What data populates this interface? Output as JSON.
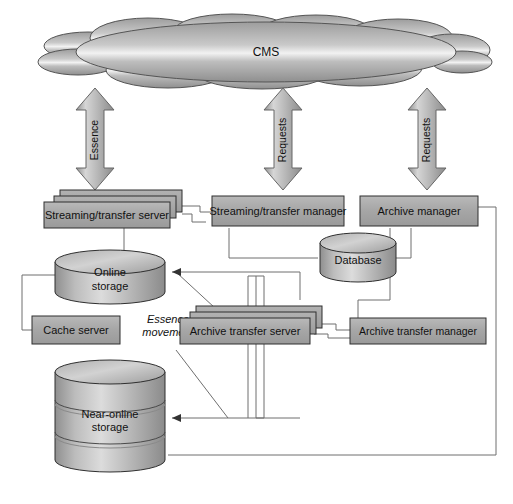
{
  "figure": {
    "background_color": "#ffffff",
    "line_color": "#6b6b6b",
    "box_fill": "#a8a8a8",
    "box_stroke": "#2f2f2f",
    "cloud_label": "CMS"
  },
  "cloud": {
    "name": "cms-cloud",
    "label": "CMS"
  },
  "arrows": [
    {
      "id": "essence",
      "label": "Essence",
      "x": 95
    },
    {
      "id": "requests-center",
      "label": "Requests",
      "x": 283
    },
    {
      "id": "requests-right",
      "label": "Requests",
      "x": 427
    }
  ],
  "nodes": {
    "streaming_transfer_server": {
      "label": "Streaming/transfer server",
      "type": "stacked-box"
    },
    "streaming_transfer_manager": {
      "label": "Streaming/transfer manager",
      "type": "box"
    },
    "archive_manager": {
      "label": "Archive manager",
      "type": "box"
    },
    "database": {
      "label": "Database",
      "type": "cylinder"
    },
    "online_storage": {
      "label_line1": "Online",
      "label_line2": "storage",
      "type": "cylinder"
    },
    "cache_server": {
      "label": "Cache server",
      "type": "box"
    },
    "archive_transfer_server": {
      "label": "Archive transfer server",
      "type": "stacked-box"
    },
    "archive_transfer_manager": {
      "label": "Archive transfer manager",
      "type": "box"
    },
    "near_online_storage": {
      "label_line1": "Near-online",
      "label_line2": "storage",
      "type": "banded-cylinder"
    }
  },
  "annotations": {
    "essence_movement_line1": "Essence",
    "essence_movement_line2": "movement"
  }
}
